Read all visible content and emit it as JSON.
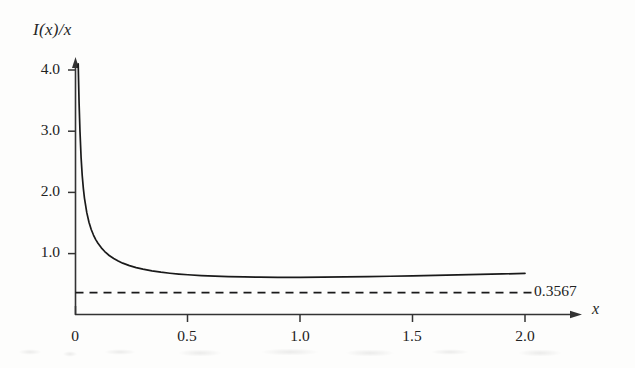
{
  "chart_data": {
    "type": "line",
    "title": "",
    "subtitle": "",
    "ylabel": "I(x)/x",
    "xlabel": "x",
    "xlim": [
      0,
      2.0
    ],
    "ylim": [
      0,
      4.2
    ],
    "grid": false,
    "legend": null,
    "xticks": [
      {
        "value": 0,
        "label": "0"
      },
      {
        "value": 0.5,
        "label": "0.5"
      },
      {
        "value": 1.0,
        "label": "1.0"
      },
      {
        "value": 1.5,
        "label": "1.5"
      },
      {
        "value": 2.0,
        "label": "2.0"
      }
    ],
    "yticks": [
      {
        "value": 1.0,
        "label": "1.0"
      },
      {
        "value": 2.0,
        "label": "2.0"
      },
      {
        "value": 3.0,
        "label": "3.0"
      },
      {
        "value": 4.0,
        "label": "4.0"
      }
    ],
    "series": [
      {
        "name": "I(x)/x",
        "style": "solid",
        "color": "#1a1a1a",
        "x": [
          0.012,
          0.016,
          0.02,
          0.025,
          0.03,
          0.035,
          0.04,
          0.05,
          0.06,
          0.07,
          0.08,
          0.09,
          0.1,
          0.115,
          0.13,
          0.15,
          0.17,
          0.19,
          0.21,
          0.24,
          0.27,
          0.3,
          0.34,
          0.38,
          0.42,
          0.46,
          0.5,
          0.56,
          0.62,
          0.68,
          0.75,
          0.82,
          0.9,
          1.0,
          1.1,
          1.2,
          1.3,
          1.4,
          1.5,
          1.6,
          1.7,
          1.8,
          1.9,
          2.0
        ],
        "y": [
          4.1,
          3.45,
          2.99,
          2.56,
          2.27,
          2.06,
          1.9,
          1.67,
          1.51,
          1.39,
          1.3,
          1.225,
          1.165,
          1.09,
          1.03,
          0.965,
          0.915,
          0.875,
          0.84,
          0.8,
          0.768,
          0.742,
          0.714,
          0.692,
          0.675,
          0.661,
          0.65,
          0.637,
          0.627,
          0.62,
          0.614,
          0.61,
          0.608,
          0.608,
          0.611,
          0.615,
          0.62,
          0.626,
          0.633,
          0.64,
          0.648,
          0.656,
          0.664,
          0.672
        ]
      }
    ],
    "reference_line": {
      "name": "asymptote",
      "orientation": "horizontal",
      "value": 0.3567,
      "label": "0.3567",
      "style": "dashed",
      "color": "#1a1a1a",
      "x_start": 0.0,
      "x_end": 2.05
    },
    "annotations": [
      {
        "name": "asymptote-value",
        "text": "0.3567",
        "x": 2.08,
        "y": 0.3567
      }
    ],
    "axes_style": {
      "x_axis_arrow": true,
      "y_axis_arrow": true,
      "spines": [
        "left",
        "bottom"
      ],
      "tick_direction": "out",
      "axis_color": "#333333"
    }
  }
}
